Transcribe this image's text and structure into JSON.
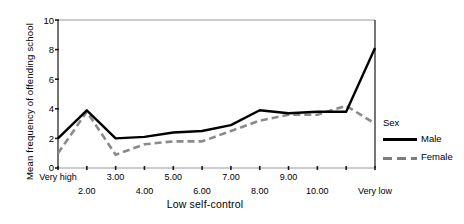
{
  "chart_data": {
    "type": "line",
    "title": "",
    "xlabel": "Low self-control",
    "ylabel": "Mean frequency of offending school",
    "categories": [
      "Very high",
      "2.00",
      "3.00",
      "4.00",
      "5.00",
      "6.00",
      "7.00",
      "8.00",
      "9.00",
      "10.00",
      "11.00",
      "Very low"
    ],
    "xtick_labels_shown": [
      "Very high",
      "2.00",
      "3.00",
      "4.00",
      "5.00",
      "6.00",
      "7.00",
      "8.00",
      "9.00",
      "10.00",
      "Very low"
    ],
    "ylim": [
      0,
      10
    ],
    "yticks": [
      0,
      2,
      4,
      6,
      8,
      10
    ],
    "grid": false,
    "legend_title": "Sex",
    "legend_position": "right",
    "series": [
      {
        "name": "Male",
        "style": "solid",
        "color": "#000000",
        "values": [
          2.0,
          3.9,
          2.0,
          2.1,
          2.4,
          2.5,
          2.9,
          3.9,
          3.7,
          3.8,
          3.8,
          8.1
        ]
      },
      {
        "name": "Female",
        "style": "dashed",
        "color": "#8a8a8a",
        "values": [
          1.0,
          3.8,
          0.9,
          1.6,
          1.8,
          1.8,
          2.5,
          3.2,
          3.6,
          3.6,
          4.2,
          3.0
        ]
      }
    ]
  },
  "axis": {
    "ytick_labels": [
      "10",
      "8",
      "6",
      "4",
      "2",
      "0"
    ]
  },
  "legend": {
    "title": "Sex",
    "items": [
      {
        "label": "Male",
        "swatch": "solid-line-swatch"
      },
      {
        "label": "Female",
        "swatch": "dashed-line-swatch"
      }
    ]
  }
}
